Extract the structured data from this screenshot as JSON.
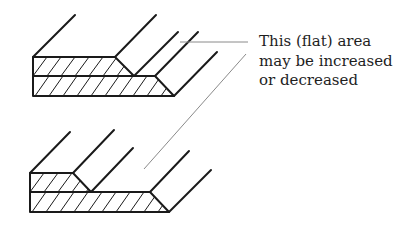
{
  "diagram": {
    "annotation": {
      "lines": [
        "This (flat) area",
        "may be increased",
        "or decreased"
      ]
    },
    "colors": {
      "stroke": "#1a1a1a",
      "leader": "#8a8a8a",
      "background": "#ffffff"
    },
    "figures": [
      {
        "name": "top-profile",
        "description": "Stepped profile with wide flat area"
      },
      {
        "name": "bottom-profile",
        "description": "Stepped profile with narrow flat area"
      }
    ]
  }
}
